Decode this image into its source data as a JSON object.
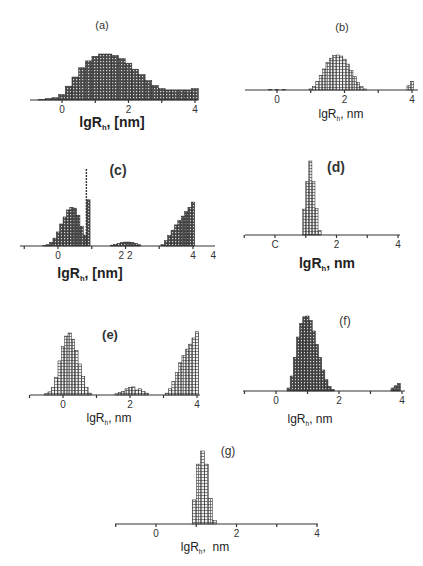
{
  "chart_data": [
    {
      "id": "a",
      "type": "bar",
      "title": "(a)",
      "xlabel": "lgR_h, [nm]",
      "xlabel_main": "lgR",
      "xlabel_sub": "h",
      "xlabel_tail": ", [nm]",
      "ticks": [
        "0",
        "2",
        "4"
      ],
      "x": [
        -0.6,
        -0.4,
        -0.2,
        0.0,
        0.2,
        0.4,
        0.6,
        0.8,
        1.0,
        1.2,
        1.4,
        1.6,
        1.8,
        2.0,
        2.2,
        2.4,
        2.6,
        2.8,
        3.0,
        3.2,
        3.4,
        3.6,
        3.8,
        4.0
      ],
      "values": [
        0.01,
        0.03,
        0.05,
        0.12,
        0.3,
        0.5,
        0.7,
        0.85,
        0.95,
        1.0,
        1.0,
        0.97,
        0.9,
        0.8,
        0.67,
        0.55,
        0.42,
        0.32,
        0.25,
        0.22,
        0.22,
        0.22,
        0.22,
        0.25
      ],
      "xlim": [
        -1,
        4.1
      ],
      "ylim": [
        0,
        1
      ],
      "grid": false,
      "style": "bold"
    },
    {
      "id": "b",
      "type": "bar",
      "title": "(b)",
      "xlabel": "lgR_h, nm",
      "xlabel_main": "lgR",
      "xlabel_sub": "h",
      "xlabel_tail": ", nm",
      "ticks": [
        "0",
        "2",
        "4"
      ],
      "x": [
        -0.2,
        0.0,
        0.2,
        1.0,
        1.1,
        1.2,
        1.3,
        1.4,
        1.5,
        1.6,
        1.7,
        1.8,
        1.9,
        2.0,
        2.1,
        2.2,
        2.3,
        2.4,
        2.5,
        2.6,
        3.9,
        4.0
      ],
      "values": [
        0.02,
        0.02,
        0.02,
        0.03,
        0.1,
        0.25,
        0.42,
        0.6,
        0.78,
        0.9,
        0.98,
        1.0,
        0.97,
        0.88,
        0.74,
        0.56,
        0.38,
        0.22,
        0.1,
        0.03,
        0.12,
        0.25
      ],
      "xlim": [
        -1,
        4.1
      ],
      "ylim": [
        0,
        1
      ],
      "grid": false,
      "style": "light"
    },
    {
      "id": "c",
      "type": "bar",
      "title": "(c)",
      "xlabel": "lgR_h, [nm]",
      "xlabel_main": "lgR",
      "xlabel_sub": "h",
      "xlabel_tail": ", [nm]",
      "ticks": [
        "0",
        "2 2",
        "4",
        "4"
      ],
      "x": [
        -0.4,
        -0.3,
        -0.2,
        -0.1,
        0.0,
        0.1,
        0.2,
        0.3,
        0.4,
        0.5,
        0.6,
        0.7,
        0.8,
        0.9,
        1.6,
        1.7,
        1.8,
        1.9,
        2.0,
        2.1,
        2.2,
        2.3,
        2.4,
        3.1,
        3.2,
        3.3,
        3.4,
        3.5,
        3.6,
        3.7,
        3.8,
        3.9,
        4.0
      ],
      "values": [
        0.01,
        0.03,
        0.08,
        0.18,
        0.32,
        0.5,
        0.66,
        0.82,
        0.88,
        0.86,
        0.7,
        0.45,
        0.25,
        1.05,
        0.02,
        0.04,
        0.06,
        0.08,
        0.09,
        0.09,
        0.08,
        0.06,
        0.03,
        0.03,
        0.12,
        0.24,
        0.36,
        0.48,
        0.58,
        0.68,
        0.78,
        0.88,
        1.0
      ],
      "special_bar": {
        "x": 0.9,
        "peak": 1.75
      },
      "xlim": [
        -1,
        4.4
      ],
      "ylim": [
        0,
        1.8
      ],
      "grid": false,
      "style": "bold"
    },
    {
      "id": "d",
      "type": "bar",
      "title": "(d)",
      "xlabel": "lgR_h, nm",
      "xlabel_main": "lgR",
      "xlabel_sub": "h",
      "xlabel_tail": ", nm",
      "ticks": [
        "C",
        "2",
        "4"
      ],
      "x": [
        0.95,
        1.05,
        1.15,
        1.25,
        1.35,
        1.45
      ],
      "values": [
        0.35,
        0.72,
        1.0,
        0.72,
        0.36,
        0.06
      ],
      "xlim": [
        -1,
        4.05
      ],
      "ylim": [
        0,
        1
      ],
      "grid": false,
      "style": "light"
    },
    {
      "id": "e",
      "type": "bar",
      "title": "(e)",
      "xlabel": "lgR_h, nm",
      "xlabel_main": "lgR",
      "xlabel_sub": "h",
      "xlabel_tail": ", nm",
      "ticks": [
        "0",
        "2",
        "4"
      ],
      "x": [
        -0.5,
        -0.4,
        -0.3,
        -0.2,
        -0.1,
        0.0,
        0.1,
        0.2,
        0.3,
        0.4,
        0.5,
        0.6,
        0.7,
        0.8,
        1.6,
        1.7,
        1.8,
        1.9,
        2.0,
        2.1,
        2.2,
        2.3,
        2.4,
        2.5,
        3.1,
        3.2,
        3.3,
        3.4,
        3.5,
        3.6,
        3.7,
        3.8,
        3.9,
        4.0
      ],
      "values": [
        0.02,
        0.05,
        0.12,
        0.28,
        0.55,
        0.78,
        0.95,
        1.0,
        0.9,
        0.72,
        0.5,
        0.3,
        0.12,
        0.03,
        0.02,
        0.04,
        0.06,
        0.1,
        0.12,
        0.13,
        0.08,
        0.1,
        0.06,
        0.03,
        0.03,
        0.1,
        0.22,
        0.36,
        0.52,
        0.64,
        0.74,
        0.82,
        0.92,
        1.02
      ],
      "xlim": [
        -1,
        4.05
      ],
      "ylim": [
        0,
        1
      ],
      "grid": false,
      "style": "light"
    },
    {
      "id": "f",
      "type": "bar",
      "title": "(f)",
      "xlabel": "lgR_h, nm",
      "xlabel_main": "lgR",
      "xlabel_sub": "h",
      "xlabel_tail": ", nm",
      "ticks": [
        "0",
        "2",
        "4"
      ],
      "x": [
        0.4,
        0.5,
        0.6,
        0.7,
        0.8,
        0.9,
        1.0,
        1.1,
        1.2,
        1.3,
        1.4,
        1.5,
        1.6,
        1.7,
        1.8,
        3.7,
        3.8,
        3.9
      ],
      "values": [
        0.04,
        0.2,
        0.45,
        0.72,
        0.9,
        0.99,
        1.0,
        0.94,
        0.8,
        0.62,
        0.45,
        0.28,
        0.15,
        0.06,
        0.02,
        0.04,
        0.07,
        0.1
      ],
      "xlim": [
        -1,
        4.1
      ],
      "ylim": [
        0,
        1
      ],
      "grid": false,
      "style": "bold"
    },
    {
      "id": "g",
      "type": "bar",
      "title": "(g)",
      "xlabel": "lgR_h, nm",
      "xlabel_main": "lgR",
      "xlabel_sub": "h",
      "xlabel_tail": ",  nm",
      "ticks": [
        "0",
        "2",
        "4"
      ],
      "x": [
        0.95,
        1.05,
        1.15,
        1.25,
        1.35,
        1.45
      ],
      "values": [
        0.33,
        0.82,
        1.0,
        0.82,
        0.35,
        0.05
      ],
      "xlim": [
        -1,
        4.0
      ],
      "ylim": [
        0,
        1
      ],
      "grid": false,
      "style": "light"
    }
  ],
  "layout": [
    {
      "id": "a",
      "x0": 30,
      "x1": 198,
      "axisY": 100,
      "h": 46,
      "tick0": 62,
      "tick4": 195,
      "titleX": 102,
      "titleY": 29,
      "titleSize": 11,
      "labX": 112,
      "labY": 127,
      "labSize": 14,
      "bold": true
    },
    {
      "id": "b",
      "x0": 245,
      "x1": 418,
      "axisY": 90,
      "h": 35,
      "tick0": 277,
      "tick4": 412,
      "titleX": 342,
      "titleY": 31,
      "titleSize": 11,
      "labX": 341,
      "labY": 118,
      "labSize": 12,
      "bold": false
    },
    {
      "id": "c",
      "x0": 20,
      "x1": 215,
      "axisY": 246,
      "h": 44,
      "tick0": 58,
      "tick4": 193,
      "titleX": 118,
      "titleY": 175,
      "titleSize": 14,
      "labX": 90,
      "labY": 278,
      "labSize": 14,
      "bold": true
    },
    {
      "id": "d",
      "x0": 245,
      "x1": 400,
      "axisY": 235,
      "h": 74,
      "tick0": 275,
      "tick4": 398,
      "titleX": 336,
      "titleY": 172,
      "titleSize": 14,
      "labX": 327,
      "labY": 268,
      "labSize": 14,
      "bold": true
    },
    {
      "id": "e",
      "x0": 30,
      "x1": 200,
      "axisY": 395,
      "h": 62,
      "tick0": 63,
      "tick4": 197,
      "titleX": 110,
      "titleY": 339,
      "titleSize": 13,
      "labX": 109,
      "labY": 422,
      "labSize": 12,
      "bold": false
    },
    {
      "id": "f",
      "x0": 243,
      "x1": 405,
      "axisY": 391,
      "h": 75,
      "tick0": 276,
      "tick4": 402,
      "titleX": 345,
      "titleY": 325,
      "titleSize": 12,
      "labX": 310,
      "labY": 423,
      "labSize": 12,
      "bold": false
    },
    {
      "id": "g",
      "x0": 115,
      "x1": 318,
      "axisY": 524,
      "h": 73,
      "tick0": 156,
      "tick4": 317,
      "titleX": 228,
      "titleY": 455,
      "titleSize": 12,
      "labX": 205,
      "labY": 551,
      "labSize": 12,
      "bold": false
    }
  ]
}
